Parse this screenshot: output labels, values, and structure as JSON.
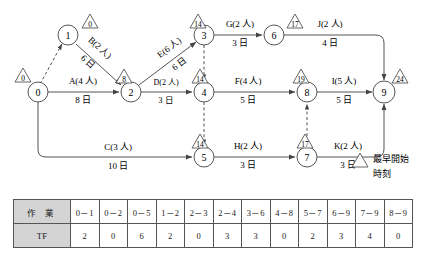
{
  "diagram": {
    "type": "network-arrow-diagram",
    "legend": {
      "symbol": "triangle",
      "line1": "最早開始",
      "line2": "時刻"
    },
    "nodes": [
      {
        "id": "0",
        "label": "0",
        "x": 38,
        "y": 92,
        "est": "0"
      },
      {
        "id": "1",
        "label": "1",
        "x": 68,
        "y": 35,
        "est": "0"
      },
      {
        "id": "2",
        "label": "2",
        "x": 131,
        "y": 92,
        "est": "8"
      },
      {
        "id": "3",
        "label": "3",
        "x": 204,
        "y": 35,
        "est": "14"
      },
      {
        "id": "4",
        "label": "4",
        "x": 204,
        "y": 92,
        "est": "14"
      },
      {
        "id": "5",
        "label": "5",
        "x": 204,
        "y": 157,
        "est": "14"
      },
      {
        "id": "6",
        "label": "6",
        "x": 274,
        "y": 35,
        "est": "17"
      },
      {
        "id": "7",
        "label": "7",
        "x": 307,
        "y": 157,
        "est": "17"
      },
      {
        "id": "8",
        "label": "8",
        "x": 307,
        "y": 92,
        "est": "19"
      },
      {
        "id": "9",
        "label": "9",
        "x": 384,
        "y": 92,
        "est": "24"
      }
    ],
    "activities": [
      {
        "code": "A",
        "from": "0",
        "to": "2",
        "crew": "A(4 人)",
        "days": "8 日"
      },
      {
        "code": "B",
        "from": "1",
        "to": "2",
        "crew": "B(2 人)",
        "days": "6 日"
      },
      {
        "code": "C",
        "from": "0",
        "to": "5",
        "crew": "C(3 人)",
        "days": "10 日"
      },
      {
        "code": "D",
        "from": "2",
        "to": "4",
        "crew": "D(2 人)",
        "days": "3 日"
      },
      {
        "code": "E",
        "from": "2",
        "to": "3",
        "crew": "E(6 人)",
        "days": "6 日"
      },
      {
        "code": "F",
        "from": "4",
        "to": "8",
        "crew": "F(4 人)",
        "days": "5 日"
      },
      {
        "code": "G",
        "from": "3",
        "to": "6",
        "crew": "G(2 人)",
        "days": "3 日"
      },
      {
        "code": "H",
        "from": "5",
        "to": "7",
        "crew": "H(2 人)",
        "days": "3 日"
      },
      {
        "code": "I",
        "from": "8",
        "to": "9",
        "crew": "I(5 人)",
        "days": "5 日"
      },
      {
        "code": "J",
        "from": "6",
        "to": "9",
        "crew": "J(2 人)",
        "days": "4 日"
      },
      {
        "code": "K",
        "from": "7",
        "to": "9",
        "crew": "K(2 人)",
        "days": "3 日"
      }
    ],
    "dummies": [
      {
        "from": "0",
        "to": "1"
      },
      {
        "from": "3",
        "to": "4"
      },
      {
        "from": "4",
        "to": "5"
      },
      {
        "from": "7",
        "to": "8"
      }
    ]
  },
  "table": {
    "row_headers": [
      "作 業",
      "TF"
    ],
    "columns": [
      "0－1",
      "0－2",
      "0－5",
      "1－2",
      "2－3",
      "2－4",
      "3－6",
      "4－8",
      "5－7",
      "6－9",
      "7－9",
      "8－9"
    ],
    "tf_values": [
      "2",
      "0",
      "6",
      "2",
      "0",
      "3",
      "3",
      "0",
      "2",
      "3",
      "4",
      "0"
    ]
  }
}
